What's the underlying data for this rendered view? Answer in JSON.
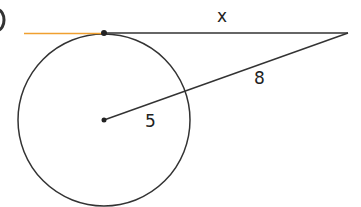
{
  "diagram": {
    "type": "circle-tangent-secant",
    "labels": {
      "tangent_length": "x",
      "external_segment": "8",
      "radius": "5"
    },
    "colors": {
      "stroke": "#333333",
      "highlight": "#f0a030"
    },
    "geometry": {
      "center": [
        104,
        120
      ],
      "radius": 86,
      "tangent_point": [
        104,
        33
      ],
      "external_point": [
        348,
        33
      ]
    }
  }
}
